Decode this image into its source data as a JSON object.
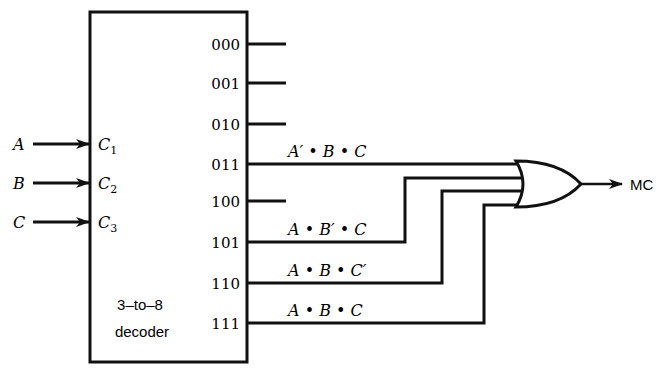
{
  "decoder": {
    "label_line1": "3–to–8",
    "label_line2": "decoder",
    "inputs": [
      {
        "signal": "A",
        "pin": "C",
        "sub": "1"
      },
      {
        "signal": "B",
        "pin": "C",
        "sub": "2"
      },
      {
        "signal": "C",
        "pin": "C",
        "sub": "3"
      }
    ],
    "outputs": [
      "000",
      "001",
      "010",
      "011",
      "100",
      "101",
      "110",
      "111"
    ]
  },
  "terms": [
    {
      "output": "011",
      "expr": "A′ • B • C"
    },
    {
      "output": "101",
      "expr": "A • B′ • C"
    },
    {
      "output": "110",
      "expr": "A • B • C′"
    },
    {
      "output": "111",
      "expr": "A • B • C"
    }
  ],
  "gate": {
    "type": "OR",
    "output_label": "MC"
  }
}
